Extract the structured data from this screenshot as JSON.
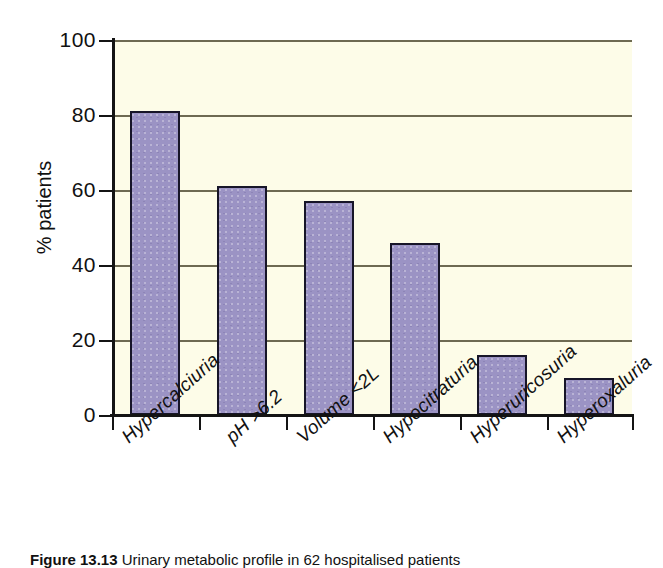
{
  "chart_data": {
    "type": "bar",
    "title": "",
    "subtitle": "",
    "xlabel": "",
    "ylabel": "% patients",
    "ylim": [
      0,
      100
    ],
    "ytick_labels": [
      "0",
      "20",
      "40",
      "60",
      "80",
      "100"
    ],
    "ytick_values": [
      0,
      20,
      40,
      60,
      80,
      100
    ],
    "grid": true,
    "grid_axis": "y",
    "legend": false,
    "legend_position": "none",
    "categories": [
      "Hypercalciuria",
      "pH >6.2",
      "Volume <2L",
      "Hypocitraturia",
      "Hyperuricosuria",
      "Hyperoxaluria"
    ],
    "values": [
      81,
      61,
      57,
      46,
      16,
      10
    ],
    "annotations": []
  },
  "colors": {
    "bar_fill": "#9b93c4",
    "bar_stroke": "#171528",
    "plot_background": "#fdfce8",
    "gridline": "#6e6a52",
    "axis": "#141414",
    "page_background": "#ffffff",
    "text": "#111111"
  },
  "caption": {
    "figure_number": "Figure 13.13",
    "text": "Urinary metabolic profile in 62 hospitalised patients"
  }
}
